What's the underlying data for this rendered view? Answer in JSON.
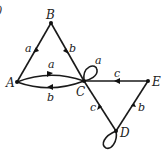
{
  "figure": {
    "corner_mark": ")",
    "nodes": [
      {
        "id": "A",
        "label": "A",
        "x": 17,
        "y": 82
      },
      {
        "id": "B",
        "label": "B",
        "x": 51,
        "y": 23
      },
      {
        "id": "C",
        "label": "C",
        "x": 84,
        "y": 81
      },
      {
        "id": "D",
        "label": "D",
        "x": 116,
        "y": 131
      },
      {
        "id": "E",
        "label": "E",
        "x": 148,
        "y": 81
      }
    ],
    "edges": [
      {
        "from": "B",
        "to": "A",
        "label": "a"
      },
      {
        "from": "B",
        "to": "C",
        "label": "b"
      },
      {
        "from": "A",
        "to": "C",
        "label": "a"
      },
      {
        "from": "C",
        "to": "A",
        "label": "b"
      },
      {
        "from": "C",
        "to": "C",
        "label": "a"
      },
      {
        "from": "E",
        "to": "C",
        "label": "c"
      },
      {
        "from": "D",
        "to": "C",
        "label": "c"
      },
      {
        "from": "D",
        "to": "E",
        "label": "b"
      },
      {
        "from": "D",
        "to": "D",
        "label": ""
      }
    ]
  }
}
